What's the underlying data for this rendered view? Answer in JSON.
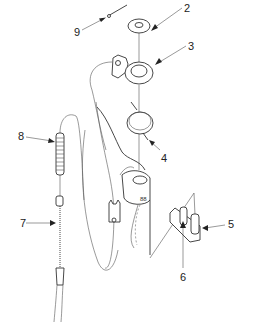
{
  "diagram": {
    "type": "exploded-parts-view",
    "callouts": [
      {
        "id": "2",
        "label": "2",
        "x": 184,
        "y": 3
      },
      {
        "id": "3",
        "label": "3",
        "x": 188,
        "y": 41
      },
      {
        "id": "4",
        "label": "4",
        "x": 161,
        "y": 153
      },
      {
        "id": "5",
        "label": "5",
        "x": 228,
        "y": 219
      },
      {
        "id": "6",
        "label": "6",
        "x": 180,
        "y": 272
      },
      {
        "id": "7",
        "label": "7",
        "x": 20,
        "y": 218
      },
      {
        "id": "8",
        "label": "8",
        "x": 18,
        "y": 131
      },
      {
        "id": "9",
        "label": "9",
        "x": 74,
        "y": 27
      }
    ],
    "parts": [
      {
        "callout": "2",
        "name": "washer"
      },
      {
        "callout": "3",
        "name": "ring-bracket"
      },
      {
        "callout": "4",
        "name": "torsion-spring"
      },
      {
        "callout": "5",
        "name": "pivot-block"
      },
      {
        "callout": "6",
        "name": "pin"
      },
      {
        "callout": "7",
        "name": "cable"
      },
      {
        "callout": "8",
        "name": "compression-spring"
      },
      {
        "callout": "9",
        "name": "rod-pin"
      }
    ]
  }
}
